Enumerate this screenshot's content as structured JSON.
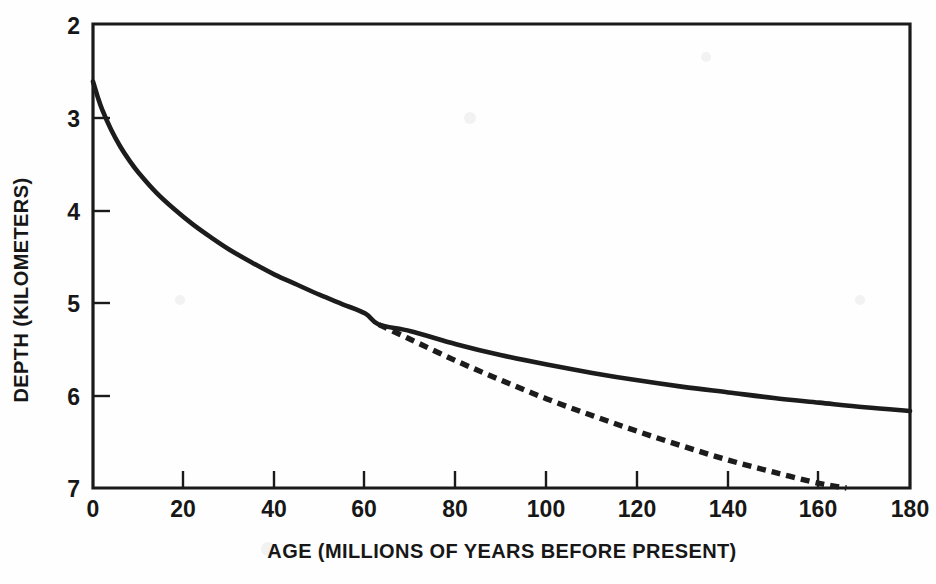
{
  "figure": {
    "background_color": "#fefefe",
    "ink_color": "#1c1c1c"
  },
  "axes": {
    "x_title": "AGE (MILLIONS OF YEARS BEFORE PRESENT)",
    "y_title": "DEPTH (KILOMETERS)",
    "x_ticks": [
      "0",
      "20",
      "40",
      "60",
      "80",
      "100",
      "120",
      "140",
      "160",
      "180"
    ],
    "y_ticks": [
      "2",
      "3",
      "4",
      "5",
      "6",
      "7"
    ]
  },
  "chart_data": {
    "type": "line",
    "title": "",
    "subtitle": "",
    "xlabel": "AGE (MILLIONS OF YEARS BEFORE PRESENT)",
    "ylabel": "DEPTH (KILOMETERS)",
    "xlim": [
      0,
      180
    ],
    "ylim": [
      7,
      2
    ],
    "y_inverted": true,
    "grid": false,
    "legend": null,
    "x_tick_values": [
      0,
      20,
      40,
      60,
      80,
      100,
      120,
      140,
      160,
      180
    ],
    "y_tick_values": [
      2,
      3,
      4,
      5,
      6,
      7
    ],
    "series": [
      {
        "name": "plate-model-depth",
        "style": "solid",
        "color": "#1c1c1c",
        "x": [
          0,
          1,
          2,
          4,
          6,
          8,
          10,
          14,
          18,
          22,
          26,
          30,
          35,
          40,
          45,
          50,
          55,
          60,
          63,
          70,
          80,
          90,
          100,
          110,
          120,
          130,
          140,
          150,
          160,
          170,
          180
        ],
        "y": [
          2.62,
          2.78,
          2.92,
          3.14,
          3.32,
          3.47,
          3.6,
          3.82,
          4.0,
          4.16,
          4.3,
          4.43,
          4.57,
          4.7,
          4.81,
          4.92,
          5.02,
          5.12,
          5.24,
          5.31,
          5.45,
          5.57,
          5.67,
          5.76,
          5.84,
          5.91,
          5.97,
          6.03,
          6.08,
          6.13,
          6.17
        ]
      },
      {
        "name": "half-space-cooling-depth",
        "style": "dashed",
        "color": "#1c1c1c",
        "x": [
          63,
          70,
          80,
          90,
          100,
          110,
          120,
          130,
          140,
          150,
          160,
          166
        ],
        "y": [
          5.24,
          5.4,
          5.63,
          5.84,
          6.04,
          6.22,
          6.39,
          6.55,
          6.7,
          6.83,
          6.95,
          7.0
        ]
      }
    ],
    "annotations": []
  }
}
